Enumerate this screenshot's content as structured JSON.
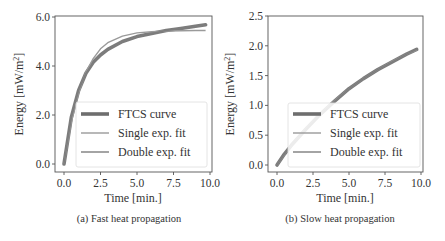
{
  "chart_data": [
    {
      "type": "line",
      "id": "a",
      "caption": "(a) Fast heat propagation",
      "xlabel": "Time [min.]",
      "ylabel": "Energy [mW/m²]",
      "xlim": [
        0,
        10
      ],
      "ylim": [
        0,
        6
      ],
      "xticks": [
        "0.0",
        "2.5",
        "5.0",
        "7.5",
        "10.0"
      ],
      "yticks": [
        "0.0",
        "2.0",
        "4.0",
        "6.0"
      ],
      "grid": false,
      "legend_position": "lower right",
      "legend": [
        "FTCS curve",
        "Single exp. fit",
        "Double exp. fit"
      ],
      "x": [
        0,
        0.5,
        1,
        1.5,
        2,
        2.5,
        3,
        4,
        5,
        6,
        7,
        8,
        9,
        9.7
      ],
      "series": [
        {
          "name": "FTCS curve",
          "values": [
            0,
            1.9,
            3.0,
            3.7,
            4.15,
            4.45,
            4.68,
            5.0,
            5.2,
            5.33,
            5.45,
            5.53,
            5.62,
            5.68
          ]
        },
        {
          "name": "Single exp. fit",
          "values": [
            0,
            1.7,
            2.9,
            3.75,
            4.3,
            4.7,
            4.95,
            5.22,
            5.35,
            5.4,
            5.43,
            5.44,
            5.45,
            5.45
          ]
        },
        {
          "name": "Double exp. fit",
          "values": [
            0,
            1.88,
            3.0,
            3.7,
            4.14,
            4.44,
            4.67,
            4.99,
            5.19,
            5.33,
            5.45,
            5.54,
            5.62,
            5.67
          ]
        }
      ]
    },
    {
      "type": "line",
      "id": "b",
      "caption": "(b) Slow heat propagation",
      "xlabel": "Time [min.]",
      "ylabel": "Energy [mW/m²]",
      "xlim": [
        0,
        10
      ],
      "ylim": [
        0,
        2.5
      ],
      "xticks": [
        "0.0",
        "2.5",
        "5.0",
        "7.5",
        "10.0"
      ],
      "yticks": [
        "0.0",
        "0.5",
        "1.0",
        "1.5",
        "2.0",
        "2.5"
      ],
      "grid": false,
      "legend_position": "lower right",
      "legend": [
        "FTCS curve",
        "Single exp. fit",
        "Double exp. fit"
      ],
      "x": [
        0,
        0.5,
        1,
        2,
        3,
        4,
        5,
        6,
        7,
        8,
        9,
        9.7
      ],
      "series": [
        {
          "name": "FTCS curve",
          "values": [
            0,
            0.18,
            0.33,
            0.6,
            0.85,
            1.07,
            1.28,
            1.45,
            1.6,
            1.73,
            1.86,
            1.94
          ]
        },
        {
          "name": "Single exp. fit",
          "values": [
            0,
            0.17,
            0.33,
            0.61,
            0.86,
            1.08,
            1.28,
            1.45,
            1.6,
            1.74,
            1.86,
            1.93
          ]
        },
        {
          "name": "Double exp. fit",
          "values": [
            0,
            0.18,
            0.33,
            0.6,
            0.85,
            1.07,
            1.28,
            1.45,
            1.6,
            1.73,
            1.86,
            1.94
          ]
        }
      ]
    }
  ],
  "colors": {
    "ftcs": "#6e6e6e",
    "single": "#9a9a9a",
    "double": "#7d7d7d",
    "axes": "#555555",
    "legend_border": "#dddddd"
  },
  "figures": {
    "a": {
      "caption": "(a) Fast heat propagation",
      "xlabel": "Time [min.]",
      "ylabel_main": "Energy [mW/m",
      "ylabel_sup": "2",
      "ylabel_end": "]",
      "xticks": [
        "0.0",
        "2.5",
        "5.0",
        "7.5",
        "10.0"
      ],
      "yticks": [
        "0.0",
        "2.0",
        "4.0",
        "6.0"
      ],
      "legend": [
        "FTCS curve",
        "Single exp. fit",
        "Double exp. fit"
      ]
    },
    "b": {
      "caption": "(b) Slow heat propagation",
      "xlabel": "Time [min.]",
      "ylabel_main": "Energy [mW/m",
      "ylabel_sup": "2",
      "ylabel_end": "]",
      "xticks": [
        "0.0",
        "2.5",
        "5.0",
        "7.5",
        "10.0"
      ],
      "yticks": [
        "0.0",
        "0.5",
        "1.0",
        "1.5",
        "2.0",
        "2.5"
      ],
      "legend": [
        "FTCS curve",
        "Single exp. fit",
        "Double exp. fit"
      ]
    }
  }
}
